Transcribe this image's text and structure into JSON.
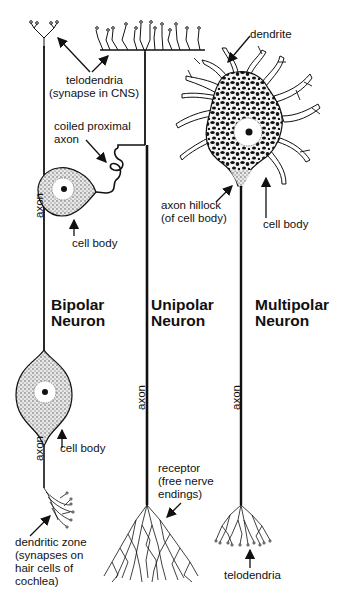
{
  "diagram": {
    "neurons": [
      {
        "id": "bipolar",
        "title_line1": "Bipolar",
        "title_line2": "Neuron",
        "labels": {
          "axon_upper": "axon",
          "axon_lower": "axon",
          "cell_body": "cell body",
          "dendritic_zone_1": "dendritic zone",
          "dendritic_zone_2": "(synapses on",
          "dendritic_zone_3": " hair cells of",
          "dendritic_zone_4": "cochlea)"
        }
      },
      {
        "id": "unipolar",
        "title_line1": "Unipolar",
        "title_line2": "Neuron",
        "labels": {
          "telodendria_1": "telodendria",
          "telodendria_2": "(synapse in CNS)",
          "coiled_1": "coiled proximal",
          "coiled_2": "axon",
          "cell_body": "cell body",
          "axon": "axon",
          "receptor_1": "receptor",
          "receptor_2": "(free nerve",
          "receptor_3": "endings)"
        }
      },
      {
        "id": "multipolar",
        "title_line1": "Multipolar",
        "title_line2": "Neuron",
        "labels": {
          "dendrite": "dendrite",
          "hillock_1": "axon hillock",
          "hillock_2": "(of cell body)",
          "cell_body": "cell body",
          "axon": "axon",
          "telodendria": "telodendria"
        }
      }
    ],
    "colors": {
      "line": "#111111",
      "stipple": "#555555",
      "background": "#ffffff"
    }
  }
}
